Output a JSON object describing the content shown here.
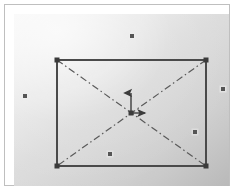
{
  "figure": {
    "title": "Rectangular plate with diagonal centre-lines and scattered point markers",
    "caption": "",
    "frame_label": "figure-frame",
    "background": {
      "type": "linear-gradient",
      "direction": "135deg",
      "start_color": "#fbfbfb",
      "mid_color": "#d8d8d8",
      "end_color": "#b9b9b9"
    },
    "border_color": "#bfbfbf",
    "canvas_size": {
      "width": 215,
      "height": 172
    }
  },
  "chart_data": {
    "type": "scatter",
    "title": "Rectangular plate with diagonal centre-lines and scattered point markers",
    "xlabel": "",
    "ylabel": "",
    "grid": false,
    "legend": "none",
    "xlim": [
      0,
      215
    ],
    "ylim": [
      0,
      172
    ],
    "note": "Coordinates are in canvas pixel space, origin at top-left of the plotted canvas.",
    "shapes": [
      {
        "name": "plate-rectangle",
        "kind": "rect",
        "x": 43,
        "y": 46,
        "width": 149,
        "height": 106,
        "stroke": "#4a4a4a",
        "stroke_width": 2,
        "fill": "none",
        "line_style": "solid"
      },
      {
        "name": "diagonal-centre-line-a",
        "kind": "line",
        "x1": 43,
        "y1": 46,
        "x2": 192,
        "y2": 152,
        "stroke": "#5a5a5a",
        "stroke_width": 1.2,
        "line_style": "dash-dot"
      },
      {
        "name": "diagonal-centre-line-b",
        "kind": "line",
        "x1": 192,
        "y1": 46,
        "x2": 43,
        "y2": 152,
        "stroke": "#5a5a5a",
        "stroke_width": 1.2,
        "line_style": "dash-dot"
      }
    ],
    "corner_nodes": [
      {
        "name": "corner-top-left",
        "x": 43,
        "y": 46
      },
      {
        "name": "corner-top-right",
        "x": 192,
        "y": 46
      },
      {
        "name": "corner-bottom-left",
        "x": 43,
        "y": 152
      },
      {
        "name": "corner-bottom-right",
        "x": 192,
        "y": 152
      }
    ],
    "origin": {
      "name": "centre-origin",
      "x": 117,
      "y": 99,
      "marker": "filled-square",
      "size": 5,
      "color": "#3c3c3c"
    },
    "vectors": [
      {
        "name": "vertical-axis-arrow",
        "direction": "up",
        "x1": 117,
        "y1": 99,
        "x2": 117,
        "y2": 79,
        "stroke": "#3c3c3c",
        "stroke_width": 1.4,
        "arrowhead": true
      },
      {
        "name": "horizontal-axis-arrow",
        "direction": "right",
        "x1": 117,
        "y1": 99,
        "x2": 131,
        "y2": 99,
        "stroke": "#3c3c3c",
        "stroke_width": 1.4,
        "arrowhead": true
      }
    ],
    "points": [
      {
        "name": "marker-top-centre",
        "x": 118,
        "y": 22,
        "inside_plate": false
      },
      {
        "name": "marker-left-outer",
        "x": 11,
        "y": 82,
        "inside_plate": false
      },
      {
        "name": "marker-right-outer",
        "x": 209,
        "y": 75,
        "inside_plate": false
      },
      {
        "name": "marker-right-inner",
        "x": 181,
        "y": 118,
        "inside_plate": true
      },
      {
        "name": "marker-bottom-inner",
        "x": 96,
        "y": 140,
        "inside_plate": true
      }
    ],
    "point_style": {
      "marker": "filled-square",
      "size": 4,
      "color": "#555555",
      "halo_color": "#e9e9e9"
    }
  }
}
